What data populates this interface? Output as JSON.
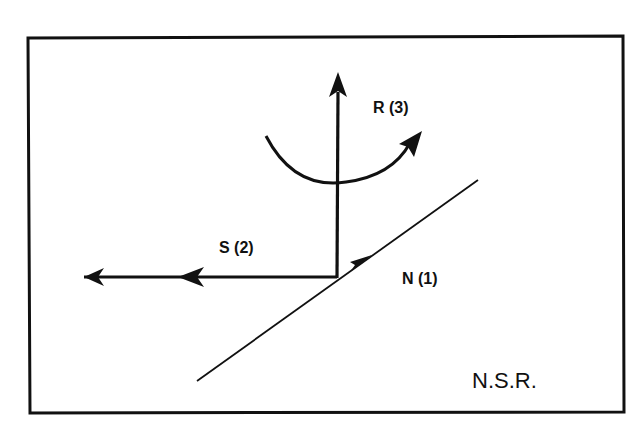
{
  "diagram": {
    "type": "force-vector diagram",
    "frame_color": "#111111",
    "stroke_color": "#111111",
    "background": "#ffffff",
    "vectors": [
      {
        "id": "N",
        "label": "N (1)",
        "direction": "along inclined plane, up-right",
        "order": 1
      },
      {
        "id": "S",
        "label": "S (2)",
        "direction": "horizontal, left",
        "order": 2
      },
      {
        "id": "R",
        "label": "R (3)",
        "direction": "vertical, up, with rotation arc",
        "order": 3
      }
    ],
    "caption": "N.S.R."
  }
}
